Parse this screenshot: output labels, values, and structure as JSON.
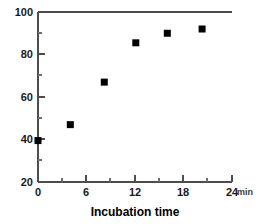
{
  "chart_data": {
    "type": "scatter",
    "title": "",
    "xlabel": "Incubation time",
    "ylabel": "",
    "x_unit": "min",
    "xlim": [
      0,
      24
    ],
    "ylim": [
      20,
      100
    ],
    "grid": false,
    "legend": null,
    "marker": "filled-square",
    "marker_color": "#000000",
    "x_ticks": [
      0,
      6,
      12,
      18,
      24
    ],
    "x_tick_labels": [
      "0",
      "6",
      "12",
      "18",
      "24"
    ],
    "x_minor_tick_step": 3,
    "y_ticks": [
      20,
      40,
      60,
      80,
      100
    ],
    "y_tick_labels": [
      "20",
      "40",
      "60",
      "80",
      "100"
    ],
    "y_minor_tick_step": 10,
    "x": [
      0,
      4,
      8.2,
      12.1,
      16,
      20.3
    ],
    "values": [
      39.5,
      47,
      67,
      85.5,
      90,
      92
    ],
    "points": [
      {
        "x": 0,
        "y": 39.5
      },
      {
        "x": 4,
        "y": 47
      },
      {
        "x": 8.2,
        "y": 67
      },
      {
        "x": 12.1,
        "y": 85.5
      },
      {
        "x": 16,
        "y": 90
      },
      {
        "x": 20.3,
        "y": 92
      }
    ]
  },
  "axes": {
    "x_axis_title": "Incubation time",
    "x_axis_unit": "min",
    "y_tick_100": "100",
    "y_tick_80": "80",
    "y_tick_60": "60",
    "y_tick_40": "40",
    "y_tick_20": "20",
    "x_tick_0": "0",
    "x_tick_6": "6",
    "x_tick_12": "12",
    "x_tick_18": "18",
    "x_tick_24": "24"
  }
}
